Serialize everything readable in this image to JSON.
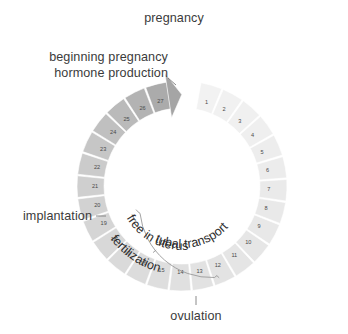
{
  "diagram": {
    "background_color": "#ffffff",
    "text_color": "#3b3b3b",
    "segment_number_color": "#4a4a4a",
    "ring": {
      "center_x": 182,
      "center_y": 186,
      "outer_radius": 105,
      "inner_radius": 78,
      "total_segments": 27,
      "start_angle_deg": -80,
      "sweep_deg": 342,
      "gap_deg": 18
    },
    "segments": [
      {
        "n": "1",
        "fill": "#f2f2f2"
      },
      {
        "n": "2",
        "fill": "#f1f1f1"
      },
      {
        "n": "3",
        "fill": "#f0f0f0"
      },
      {
        "n": "4",
        "fill": "#efefef"
      },
      {
        "n": "5",
        "fill": "#ededed"
      },
      {
        "n": "6",
        "fill": "#ececec"
      },
      {
        "n": "7",
        "fill": "#eaeaea"
      },
      {
        "n": "8",
        "fill": "#e9e9e9"
      },
      {
        "n": "9",
        "fill": "#e8e8e8"
      },
      {
        "n": "10",
        "fill": "#e6e6e6"
      },
      {
        "n": "11",
        "fill": "#e5e5e5"
      },
      {
        "n": "12",
        "fill": "#e3e3e3"
      },
      {
        "n": "13",
        "fill": "#e2e2e2"
      },
      {
        "n": "14",
        "fill": "#e0e0e0"
      },
      {
        "n": "15",
        "fill": "#dedede"
      },
      {
        "n": "16",
        "fill": "#dcdcdc"
      },
      {
        "n": "17",
        "fill": "#dadada"
      },
      {
        "n": "18",
        "fill": "#d8d8d8"
      },
      {
        "n": "19",
        "fill": "#d5d5d5"
      },
      {
        "n": "20",
        "fill": "#d2d2d2"
      },
      {
        "n": "21",
        "fill": "#cfcfcf"
      },
      {
        "n": "22",
        "fill": "#cbcbcb"
      },
      {
        "n": "23",
        "fill": "#c6c6c6"
      },
      {
        "n": "24",
        "fill": "#c0c0c0"
      },
      {
        "n": "25",
        "fill": "#bababa"
      },
      {
        "n": "26",
        "fill": "#b3b3b3"
      },
      {
        "n": "27",
        "fill": "#ababab"
      }
    ],
    "arrow": {
      "name": "pregnancy-arrow-head",
      "fill": "#a5a5a5"
    },
    "labels": {
      "pregnancy": "pregnancy",
      "beginning_pregnancy": "beginning pregnancy",
      "hormone_production": "hormone production",
      "implantation": "implantation",
      "free_in_uterus": "free in uterus",
      "tubal_transport": "tubal transport",
      "fertilization": "fertilization",
      "ovulation": "ovulation"
    }
  }
}
